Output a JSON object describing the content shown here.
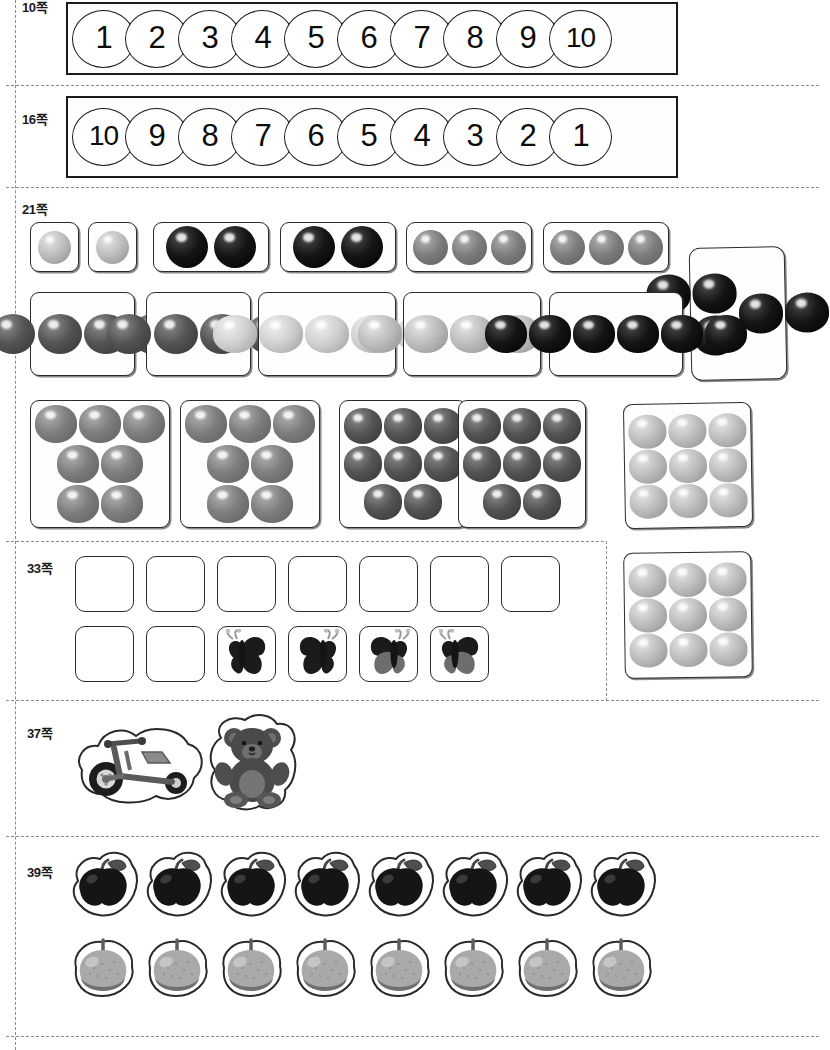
{
  "document": {
    "kind": "worksheet-cutout-sheet",
    "language": "ko"
  },
  "sections": [
    {
      "id": "p10",
      "label": "10쪽",
      "type": "number-strip",
      "numbers": [
        "1",
        "2",
        "3",
        "4",
        "5",
        "6",
        "7",
        "8",
        "9",
        "10"
      ]
    },
    {
      "id": "p16",
      "label": "16쪽",
      "type": "number-strip",
      "numbers": [
        "10",
        "9",
        "8",
        "7",
        "6",
        "5",
        "4",
        "3",
        "2",
        "1"
      ]
    },
    {
      "id": "p21",
      "label": "21쪽",
      "type": "dot-cards",
      "rows": [
        {
          "cards": [
            {
              "count": 1,
              "tone": "light",
              "layout": "1"
            },
            {
              "count": 1,
              "tone": "light",
              "layout": "1"
            },
            {
              "count": 2,
              "tone": "black",
              "layout": "2"
            },
            {
              "count": 2,
              "tone": "black",
              "layout": "2"
            },
            {
              "count": 3,
              "tone": "mid",
              "layout": "3"
            },
            {
              "count": 3,
              "tone": "mid",
              "layout": "3"
            }
          ]
        },
        {
          "cards": [
            {
              "count": 4,
              "tone": "dark",
              "layout": "2x2"
            },
            {
              "count": 4,
              "tone": "dark",
              "layout": "2x2"
            },
            {
              "count": 5,
              "tone": "pale",
              "layout": "3+2"
            },
            {
              "count": 5,
              "tone": "light",
              "layout": "3+2"
            },
            {
              "count": 6,
              "tone": "black",
              "layout": "3x2"
            },
            {
              "count": 6,
              "tone": "black",
              "layout": "2x3-tall"
            }
          ]
        },
        {
          "cards": [
            {
              "count": 7,
              "tone": "mid",
              "layout": "7"
            },
            {
              "count": 7,
              "tone": "mid",
              "layout": "7"
            },
            {
              "count": 8,
              "tone": "dark",
              "layout": "3+3+2"
            },
            {
              "count": 8,
              "tone": "dark",
              "layout": "3+3+2"
            },
            {
              "count": 9,
              "tone": "light",
              "layout": "3x3"
            }
          ]
        }
      ]
    },
    {
      "id": "p33",
      "label": "33쪽",
      "type": "blank-and-butterfly-cards",
      "row1_blank_count": 7,
      "row2_blank_count": 2,
      "butterflies": [
        {
          "tone": "black",
          "facing": "right"
        },
        {
          "tone": "black",
          "facing": "left"
        },
        {
          "tone": "two-tone",
          "facing": "left"
        },
        {
          "tone": "two-tone",
          "facing": "right"
        }
      ],
      "side_card": {
        "count": 9,
        "tone": "light",
        "layout": "3x3"
      }
    },
    {
      "id": "p37",
      "label": "37쪽",
      "type": "toy-stickers",
      "items": [
        {
          "name": "tricycle-sticker"
        },
        {
          "name": "teddy-bear-sticker"
        }
      ]
    },
    {
      "id": "p39",
      "label": "39쪽",
      "type": "fruit-stickers",
      "rows": [
        {
          "name": "apple-sticker",
          "tone": "dark",
          "count": 8
        },
        {
          "name": "pear-sticker",
          "tone": "light",
          "count": 8
        }
      ]
    }
  ],
  "colors": {
    "ink": "#1b1b1b",
    "dash": "#8a8a8a",
    "paper": "#ffffff"
  }
}
